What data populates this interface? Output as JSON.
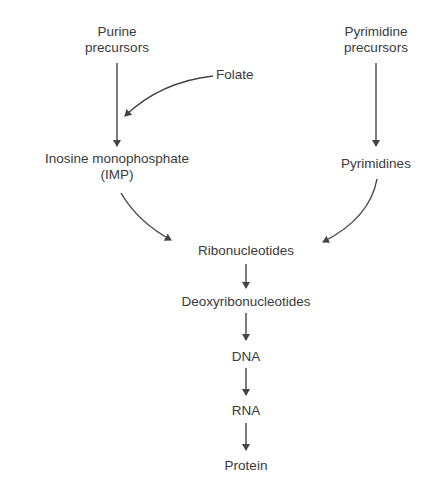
{
  "diagram": {
    "type": "flowchart",
    "nodes": {
      "purine_precursors": {
        "line1": "Purine",
        "line2": "precursors"
      },
      "pyrimidine_precursors": {
        "line1": "Pyrimidine",
        "line2": "precursors"
      },
      "folate": {
        "label": "Folate"
      },
      "imp": {
        "line1": "Inosine monophosphate",
        "line2": "(IMP)"
      },
      "pyrimidines": {
        "label": "Pyrimidines"
      },
      "ribonucleotides": {
        "label": "Ribonucleotides"
      },
      "deoxyribonucleotides": {
        "label": "Deoxyribonucleotides"
      },
      "dna": {
        "label": "DNA"
      },
      "rna": {
        "label": "RNA"
      },
      "protein": {
        "label": "Protein"
      }
    },
    "edges": [
      {
        "from": "Purine precursors",
        "to": "Inosine monophosphate (IMP)"
      },
      {
        "from": "Folate",
        "to": "Purine precursors → IMP arrow"
      },
      {
        "from": "Pyrimidine precursors",
        "to": "Pyrimidines"
      },
      {
        "from": "Inosine monophosphate (IMP)",
        "to": "Ribonucleotides"
      },
      {
        "from": "Pyrimidines",
        "to": "Ribonucleotides"
      },
      {
        "from": "Ribonucleotides",
        "to": "Deoxyribonucleotides"
      },
      {
        "from": "Deoxyribonucleotides",
        "to": "DNA"
      },
      {
        "from": "DNA",
        "to": "RNA"
      },
      {
        "from": "RNA",
        "to": "Protein"
      }
    ],
    "colors": {
      "text": "#3a3a3a",
      "arrow": "#444444",
      "background": "#ffffff"
    }
  }
}
